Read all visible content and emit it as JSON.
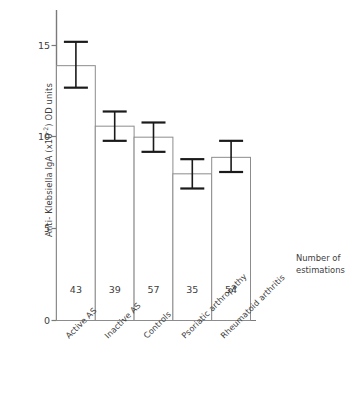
{
  "chart_data": {
    "type": "bar",
    "title": "",
    "subtitle": "",
    "xlabel": "",
    "ylabel": "Anti- Klebsiella IgA (x10-2) OD units",
    "ylabel_prefix": "Anti- Klebsiella IgA (x10",
    "ylabel_exponent": "-2",
    "ylabel_suffix": ") OD units",
    "categories": [
      "Active AS",
      "Inactive AS",
      "Controls",
      "Psoriatic arthropathy",
      "Rheumatoid arthritis"
    ],
    "values": [
      13.9,
      10.6,
      10.0,
      8.0,
      8.9
    ],
    "errors_upper": [
      15.2,
      11.4,
      10.8,
      8.8,
      9.8
    ],
    "errors_lower": [
      12.7,
      9.8,
      9.2,
      7.2,
      8.1
    ],
    "error_plus": [
      1.3,
      0.8,
      0.8,
      0.8,
      0.9
    ],
    "error_minus": [
      1.2,
      0.8,
      0.8,
      0.8,
      0.8
    ],
    "n_values": [
      43,
      39,
      57,
      35,
      54
    ],
    "n_label": "Number of estimations",
    "ylim": [
      0,
      16.5
    ],
    "yticks": [
      0,
      5,
      10,
      15
    ],
    "ytick_labels": [
      "0",
      "5",
      "10",
      "15"
    ],
    "grid": false,
    "legend": "none",
    "bar_facecolor": "#ffffff",
    "bar_edgecolor": "#8c8c8c",
    "error_color": "#1a1a1a",
    "axis_color": "#7a7a7a",
    "text_color": "#3d3d3d"
  },
  "annotation": {
    "line1": "Number of",
    "line2": "estimations"
  }
}
